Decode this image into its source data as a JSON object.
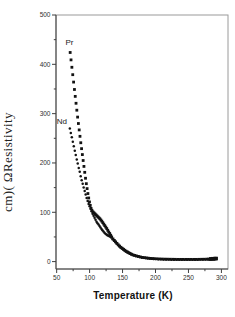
{
  "figure": {
    "background": "#ffffff",
    "marker_color": "#121212",
    "axis_color": "#3f3f3f",
    "box_color": "#9a9a9a"
  },
  "chart_data": {
    "type": "scatter",
    "title": "",
    "xlabel": "Temperature (K)",
    "ylabel": "cm)( ΩResistivity",
    "xlim": [
      49,
      310
    ],
    "ylim": [
      -15,
      500
    ],
    "grid": false,
    "legend": "none (in-plot text labels)",
    "x_major_ticks": [
      50,
      100,
      150,
      200,
      250,
      300
    ],
    "x_minor_ticks": [
      75,
      125,
      175,
      225,
      275
    ],
    "y_major_ticks": [
      0,
      100,
      200,
      300,
      400,
      500
    ],
    "y_minor_ticks": [
      50,
      150,
      250,
      350,
      450
    ],
    "annotations": [
      {
        "text": "Pr",
        "x": 69.5,
        "y": 445
      },
      {
        "text": "Nd",
        "x": 58,
        "y": 285
      }
    ],
    "series": [
      {
        "name": "Pr",
        "marker": "square",
        "points": [
          [
            70.5,
            424
          ],
          [
            71.8,
            409
          ],
          [
            73.1,
            394
          ],
          [
            74.4,
            379
          ],
          [
            75.7,
            364
          ],
          [
            77,
            349
          ],
          [
            78.2,
            335
          ],
          [
            79.4,
            321
          ],
          [
            80.6,
            307
          ],
          [
            81.8,
            293
          ],
          [
            83,
            280
          ],
          [
            84.2,
            267
          ],
          [
            85.4,
            254
          ],
          [
            86.6,
            241
          ],
          [
            87.8,
            229
          ],
          [
            89,
            217
          ],
          [
            90.2,
            205
          ],
          [
            91.4,
            193
          ],
          [
            92.6,
            181
          ],
          [
            93.8,
            169
          ],
          [
            95,
            158
          ],
          [
            96.2,
            148
          ],
          [
            97.4,
            138
          ],
          [
            98.6,
            129
          ],
          [
            99.8,
            121
          ],
          [
            101,
            114
          ],
          [
            102.2,
            108
          ],
          [
            103.5,
            104
          ],
          [
            105,
            101
          ],
          [
            106.5,
            99
          ],
          [
            108,
            97
          ],
          [
            109.5,
            95
          ],
          [
            111,
            93
          ],
          [
            112.5,
            91
          ],
          [
            114,
            89
          ],
          [
            115.5,
            87
          ],
          [
            117,
            84.5
          ],
          [
            118.5,
            82
          ],
          [
            120,
            79
          ],
          [
            121.5,
            76
          ],
          [
            123,
            73
          ],
          [
            124.5,
            70
          ],
          [
            126,
            67
          ],
          [
            127.5,
            63.5
          ],
          [
            129,
            60
          ],
          [
            130.5,
            57
          ],
          [
            132,
            53.5
          ],
          [
            133.5,
            50
          ],
          [
            135.5,
            46
          ],
          [
            137.5,
            43
          ],
          [
            139.5,
            40
          ],
          [
            141.5,
            37
          ],
          [
            143.5,
            34
          ],
          [
            145.5,
            31.5
          ],
          [
            147.5,
            29
          ],
          [
            149.5,
            27
          ],
          [
            151.5,
            25
          ],
          [
            153.5,
            23
          ],
          [
            155.5,
            21
          ],
          [
            157.5,
            19.5
          ],
          [
            159.5,
            18
          ],
          [
            161.5,
            16.5
          ],
          [
            163.5,
            15
          ],
          [
            166,
            13.5
          ],
          [
            168.5,
            12.5
          ],
          [
            171,
            11.5
          ],
          [
            174,
            10.5
          ],
          [
            177,
            9.5
          ],
          [
            180,
            8.5
          ],
          [
            183,
            8
          ],
          [
            186,
            7.5
          ],
          [
            189,
            7
          ],
          [
            192,
            6.5
          ],
          [
            195,
            6.2
          ],
          [
            198,
            6
          ],
          [
            202,
            5.7
          ],
          [
            206,
            5.4
          ],
          [
            210,
            5.2
          ],
          [
            214,
            5
          ],
          [
            218,
            4.9
          ],
          [
            222,
            4.8
          ],
          [
            226,
            4.7
          ],
          [
            230,
            4.6
          ],
          [
            234,
            4.5
          ],
          [
            238,
            4.5
          ],
          [
            242,
            4.5
          ],
          [
            246,
            4.5
          ],
          [
            250,
            4.5
          ],
          [
            254,
            4.5
          ],
          [
            258,
            4.5
          ],
          [
            262,
            4.5
          ],
          [
            266,
            4.6
          ],
          [
            270,
            4.7
          ],
          [
            274,
            4.8
          ],
          [
            278,
            5
          ],
          [
            281,
            5.2
          ],
          [
            284,
            5.5
          ],
          [
            287,
            5.8
          ],
          [
            290,
            6
          ],
          [
            292,
            6.2
          ]
        ]
      },
      {
        "name": "Nd",
        "marker": "circle",
        "points": [
          [
            70,
            270
          ],
          [
            71.5,
            261
          ],
          [
            73,
            252
          ],
          [
            74.5,
            243
          ],
          [
            76,
            234
          ],
          [
            77.5,
            225
          ],
          [
            79,
            216
          ],
          [
            80.5,
            207
          ],
          [
            82,
            199
          ],
          [
            83.5,
            190
          ],
          [
            85,
            182
          ],
          [
            86.5,
            173
          ],
          [
            88,
            165
          ],
          [
            89.5,
            158
          ],
          [
            91,
            150
          ],
          [
            92.5,
            143
          ],
          [
            94,
            136
          ],
          [
            95.5,
            129
          ],
          [
            97,
            123
          ],
          [
            98.5,
            117
          ],
          [
            100,
            112
          ],
          [
            101.5,
            107
          ],
          [
            103,
            102
          ],
          [
            104.5,
            97
          ],
          [
            106,
            93
          ],
          [
            107.5,
            89
          ],
          [
            109,
            85
          ],
          [
            110.5,
            81
          ],
          [
            112,
            78
          ],
          [
            113.5,
            75
          ],
          [
            115,
            72
          ],
          [
            116.5,
            69
          ],
          [
            118,
            66
          ],
          [
            119.5,
            63.5
          ],
          [
            121,
            61
          ],
          [
            122.5,
            58.5
          ],
          [
            124,
            56.5
          ],
          [
            125.5,
            55
          ],
          [
            127,
            53.5
          ],
          [
            128.5,
            52.5
          ],
          [
            130,
            51.5
          ],
          [
            131.5,
            50.5
          ],
          [
            133,
            49
          ],
          [
            135,
            45.5
          ],
          [
            137,
            42.5
          ],
          [
            139,
            39.5
          ],
          [
            141,
            36.5
          ],
          [
            143,
            33.5
          ],
          [
            145,
            31
          ],
          [
            147,
            28.5
          ],
          [
            149,
            26.5
          ],
          [
            151,
            24.5
          ],
          [
            153,
            22.5
          ],
          [
            155,
            20.5
          ],
          [
            157,
            19
          ],
          [
            159,
            17.5
          ],
          [
            161,
            16
          ],
          [
            163,
            14.8
          ],
          [
            165,
            13.8
          ],
          [
            167,
            12.8
          ],
          [
            170,
            11.5
          ],
          [
            173,
            10.3
          ],
          [
            176,
            9.3
          ],
          [
            179,
            8.4
          ],
          [
            182,
            7.7
          ],
          [
            185,
            7.1
          ],
          [
            188,
            6.6
          ],
          [
            191,
            6.1
          ],
          [
            194,
            5.7
          ],
          [
            197,
            5.4
          ],
          [
            200,
            5.1
          ],
          [
            204,
            4.8
          ],
          [
            208,
            4.6
          ],
          [
            212,
            4.4
          ],
          [
            216,
            4.2
          ],
          [
            220,
            4.1
          ],
          [
            224,
            4
          ],
          [
            228,
            4
          ],
          [
            232,
            4
          ],
          [
            236,
            4
          ],
          [
            240,
            4
          ],
          [
            244,
            4
          ],
          [
            248,
            4
          ],
          [
            252,
            4
          ],
          [
            256,
            4
          ],
          [
            260,
            4
          ],
          [
            264,
            4
          ],
          [
            268,
            4.1
          ],
          [
            272,
            4.2
          ],
          [
            276,
            4.3
          ],
          [
            280,
            4.5
          ],
          [
            283,
            4.7
          ],
          [
            286,
            5
          ],
          [
            289,
            5.3
          ]
        ]
      }
    ]
  }
}
